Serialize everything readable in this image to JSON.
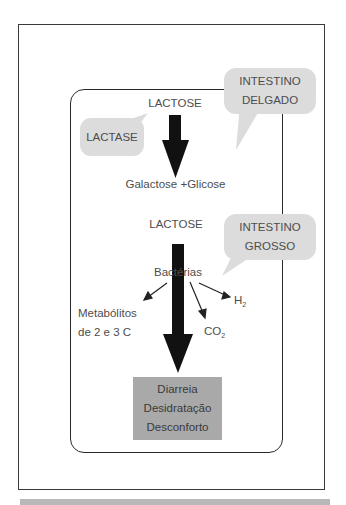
{
  "diagram": {
    "small_intestine": {
      "bubble_lines": [
        "INTESTINO",
        "DELGADO"
      ],
      "input": "LACTOSE",
      "enzyme": "LACTASE",
      "products": "Galactose +Glicose"
    },
    "large_intestine": {
      "bubble_lines": [
        "INTESTINO",
        "GROSSO"
      ],
      "input": "LACTOSE",
      "agent": "Bactérias",
      "byproducts": {
        "metabolites_line1": "Metabólitos",
        "metabolites_line2": "de 2 e 3 C",
        "co2_main": "CO",
        "co2_sub": "2",
        "h2_main": "H",
        "h2_sub": "2"
      },
      "outcomes": [
        "Diarreia",
        "Desidratação",
        "Desconforto"
      ]
    },
    "colors": {
      "bubble_fill": "#dcdcdc",
      "result_fill": "#a9a9a9",
      "arrow": "#111111",
      "frame": "#2a2a2a",
      "bottom_bar": "#b8b8b8"
    }
  }
}
